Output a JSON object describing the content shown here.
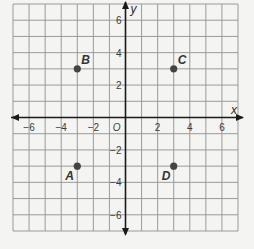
{
  "chart_data": {
    "type": "scatter",
    "title": "",
    "xlabel": "x",
    "ylabel": "y",
    "xlim": [
      -7,
      7
    ],
    "ylim": [
      -7,
      7
    ],
    "grid": true,
    "origin_label": "O",
    "x_ticks": [
      -6,
      -4,
      -2,
      2,
      4,
      6
    ],
    "y_ticks": [
      6,
      4,
      2,
      -2,
      -4,
      -6
    ],
    "x_tick_labels": [
      "−6",
      "−4",
      "−2",
      "2",
      "4",
      "6"
    ],
    "y_tick_labels": [
      "6",
      "4",
      "2",
      "−2",
      "−4",
      "−6"
    ],
    "points": [
      {
        "label": "A",
        "x": -3,
        "y": -3
      },
      {
        "label": "B",
        "x": -3,
        "y": 3
      },
      {
        "label": "C",
        "x": 3,
        "y": 3
      },
      {
        "label": "D",
        "x": 3,
        "y": -3
      }
    ]
  },
  "colors": {
    "background": "#f4f4f2",
    "grid": "#9a9a9a",
    "axis": "#1a1a1a",
    "point": "#444444"
  }
}
